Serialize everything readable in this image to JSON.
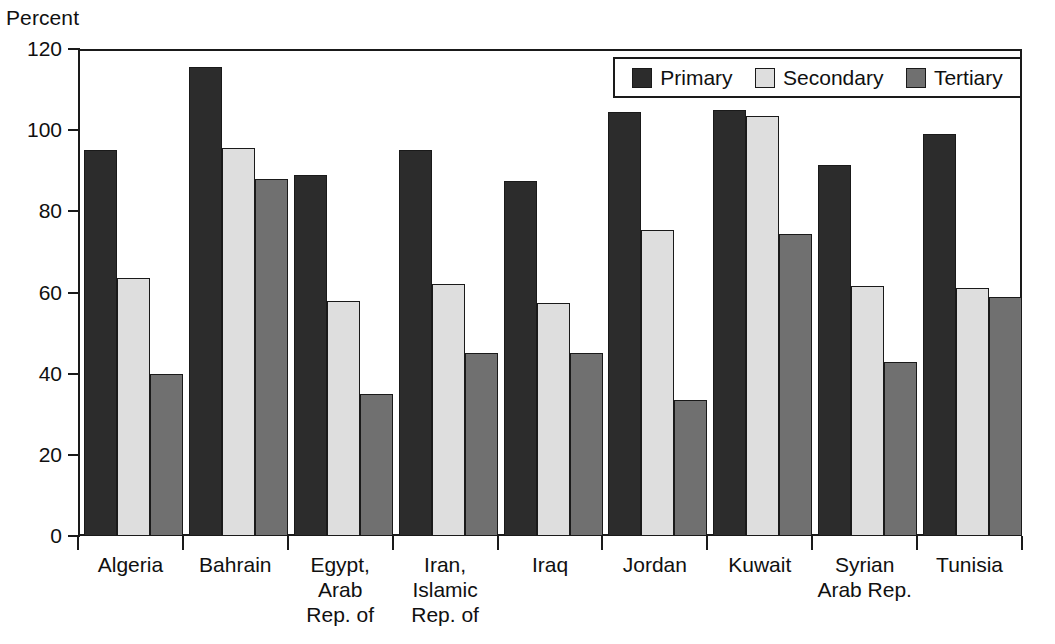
{
  "chart_data": {
    "type": "bar",
    "title": "",
    "subtitle": "",
    "xlabel": "",
    "ylabel": "Percent",
    "ylim": [
      0,
      120
    ],
    "yticks": [
      0,
      20,
      40,
      60,
      80,
      100,
      120
    ],
    "grid": false,
    "legend_position": "top-right",
    "categories": [
      "Algeria",
      "Bahrain",
      "Egypt,\nArab\nRep. of",
      "Iran,\nIslamic\nRep. of",
      "Iraq",
      "Jordan",
      "Kuwait",
      "Syrian\nArab Rep.",
      "Tunisia"
    ],
    "series": [
      {
        "name": "Primary",
        "color": "#2c2c2c",
        "values": [
          95,
          115.5,
          89,
          95,
          87.5,
          104.5,
          105,
          91.5,
          99
        ]
      },
      {
        "name": "Secondary",
        "color": "#dedede",
        "values": [
          63.5,
          95.5,
          58,
          62,
          57.5,
          75.5,
          103.5,
          61.5,
          61
        ]
      },
      {
        "name": "Tertiary",
        "color": "#707070",
        "values": [
          40,
          88,
          35,
          45,
          45,
          33.5,
          74.5,
          43,
          59
        ]
      }
    ]
  },
  "legend": {
    "items": [
      {
        "label": "Primary",
        "swatch": "primary"
      },
      {
        "label": "Secondary",
        "swatch": "secondary"
      },
      {
        "label": "Tertiary",
        "swatch": "tertiary"
      }
    ]
  }
}
